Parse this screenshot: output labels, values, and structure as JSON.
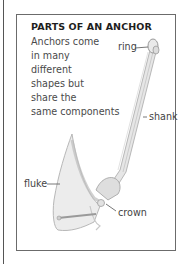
{
  "diagram": {
    "title": "PARTS OF AN ANCHOR",
    "description_lines": [
      "Anchors come",
      "in many",
      "different",
      "shapes but",
      "share the",
      "same components"
    ],
    "labels": {
      "ring": "ring",
      "shank": "shank",
      "fluke": "fluke",
      "crown": "crown"
    },
    "colors": {
      "border": "#6b6b6b",
      "text": "#4a4a4a",
      "title": "#1e1e1e",
      "illustration_shade": "#bdbdbd"
    }
  }
}
